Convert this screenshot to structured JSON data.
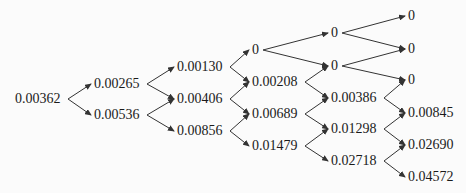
{
  "tree": {
    "type": "binomial-tree",
    "columns": [
      {
        "x": 15,
        "nodes": [
          {
            "label": "0.00362",
            "y": 99
          }
        ]
      },
      {
        "x": 94,
        "nodes": [
          {
            "label": "0.00265",
            "y": 84
          },
          {
            "label": "0.00536",
            "y": 115
          }
        ]
      },
      {
        "x": 177,
        "nodes": [
          {
            "label": "0.00130",
            "y": 67
          },
          {
            "label": "0.00406",
            "y": 99
          },
          {
            "label": "0.00856",
            "y": 131
          }
        ]
      },
      {
        "x": 252,
        "nodes": [
          {
            "label": "0",
            "y": 50
          },
          {
            "label": "0.00208",
            "y": 82
          },
          {
            "label": "0.00689",
            "y": 114
          },
          {
            "label": "0.01479",
            "y": 146
          }
        ]
      },
      {
        "x": 331,
        "nodes": [
          {
            "label": "0",
            "y": 33
          },
          {
            "label": "0",
            "y": 66
          },
          {
            "label": "0.00386",
            "y": 98
          },
          {
            "label": "0.01298",
            "y": 129
          },
          {
            "label": "0.02718",
            "y": 161
          }
        ]
      },
      {
        "x": 408,
        "nodes": [
          {
            "label": "0",
            "y": 16
          },
          {
            "label": "0",
            "y": 49
          },
          {
            "label": "0",
            "y": 80
          },
          {
            "label": "0.00845",
            "y": 113
          },
          {
            "label": "0.02690",
            "y": 145
          },
          {
            "label": "0.04572",
            "y": 177
          }
        ]
      }
    ],
    "colors": {
      "text": "#1a1a1a",
      "arrow": "#333333",
      "background": "#fbfbfb"
    }
  }
}
